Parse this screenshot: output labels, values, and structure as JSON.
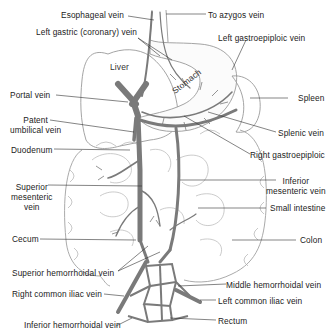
{
  "diagram": {
    "colors": {
      "vein": "#7a7a7a",
      "outline": "#9a9a9a",
      "leader": "#333333",
      "text": "#222222"
    },
    "organ_labels": {
      "liver": "Liver",
      "stomach": "Stomach"
    },
    "labels_left": [
      {
        "id": "esophageal-vein",
        "text": "Esophageal vein"
      },
      {
        "id": "left-gastric-vein",
        "text": "Left gastric (coronary) vein"
      },
      {
        "id": "portal-vein",
        "text": "Portal vein"
      },
      {
        "id": "patent-umbilical-vein",
        "text": "Patent umbilical vein",
        "lines": [
          "Patent",
          "umbilical vein"
        ]
      },
      {
        "id": "duodenum",
        "text": "Duodenum"
      },
      {
        "id": "superior-mesenteric-vein",
        "text": "Superior mesenteric vein",
        "lines": [
          "Superior",
          "mesenteric",
          "vein"
        ]
      },
      {
        "id": "cecum",
        "text": "Cecum"
      },
      {
        "id": "superior-hemorrhoidal-vein",
        "text": "Superior hemorrhoidal vein"
      },
      {
        "id": "right-common-iliac-vein",
        "text": "Right common iliac vein"
      },
      {
        "id": "inferior-hemorrhoidal-vein",
        "text": "Inferior hemorrhoidal vein"
      }
    ],
    "labels_right": [
      {
        "id": "to-azygos-vein",
        "text": "To azygos vein"
      },
      {
        "id": "left-gastroepiploic-vein",
        "text": "Left gastroepiploic vein"
      },
      {
        "id": "spleen",
        "text": "Spleen"
      },
      {
        "id": "splenic-vein",
        "text": "Splenic vein"
      },
      {
        "id": "right-gastroepiploic",
        "text": "Right gastroepiploic"
      },
      {
        "id": "inferior-mesenteric-vein",
        "text": "Inferior mesenteric vein",
        "lines": [
          "Inferior",
          "mesenteric vein"
        ]
      },
      {
        "id": "small-intestine",
        "text": "Small intestine"
      },
      {
        "id": "colon",
        "text": "Colon"
      },
      {
        "id": "middle-hemorrhoidal-vein",
        "text": "Middle hemorrhoidal vein"
      },
      {
        "id": "left-common-iliac-vein",
        "text": "Left common iliac vein"
      },
      {
        "id": "rectum",
        "text": "Rectum"
      }
    ]
  }
}
